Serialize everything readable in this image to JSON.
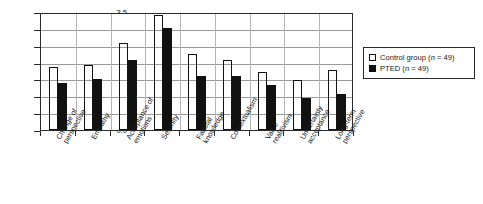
{
  "chart_data": {
    "type": "bar",
    "title": "",
    "xlabel": "",
    "ylabel": "",
    "ylim": [
      0.0,
      3.5
    ],
    "grid": true,
    "legend_position": "right",
    "categories": [
      "Change of perspective",
      "Empathy",
      "Acceptance of emotions",
      "Serenity",
      "Facutal knowledge",
      "Contextualism",
      "Value realitivism",
      "Uncertainty acceptance",
      "Long-term perspective"
    ],
    "category_lines": [
      [
        "Change of",
        "perspective"
      ],
      [
        "Empathy"
      ],
      [
        "Acceptance of",
        "emotions"
      ],
      [
        "Serenity"
      ],
      [
        "Facutal",
        "knowledge"
      ],
      [
        "Contextualism"
      ],
      [
        "Value",
        "realitivism"
      ],
      [
        "Uncertainty",
        "acceptance"
      ],
      [
        "Long-term",
        "perspective"
      ]
    ],
    "yticks": [
      "0.0",
      "0.5",
      "1.0",
      "1.5",
      "2.0",
      "2.5",
      "3.0",
      "3.5"
    ],
    "ytick_values": [
      0.0,
      0.5,
      1.0,
      1.5,
      2.0,
      2.5,
      3.0,
      3.5
    ],
    "series": [
      {
        "name": "Control group (n = 49)",
        "key": "control",
        "color": "#ffffff",
        "values": [
          1.88,
          1.92,
          2.58,
          3.4,
          2.25,
          2.08,
          1.72,
          1.48,
          1.78
        ]
      },
      {
        "name": "PTED (n = 49)",
        "key": "pted",
        "color": "#111111",
        "values": [
          1.4,
          1.52,
          2.07,
          3.03,
          1.6,
          1.6,
          1.35,
          0.96,
          1.08
        ]
      }
    ]
  },
  "legend": {
    "items": [
      {
        "label_main": "Control group (",
        "label_n": "n",
        "label_tail": " = 49)",
        "swatch": "open-square"
      },
      {
        "label_main": "PTED (",
        "label_n": "n",
        "label_tail": " = 49)",
        "swatch": "filled-square"
      }
    ]
  }
}
